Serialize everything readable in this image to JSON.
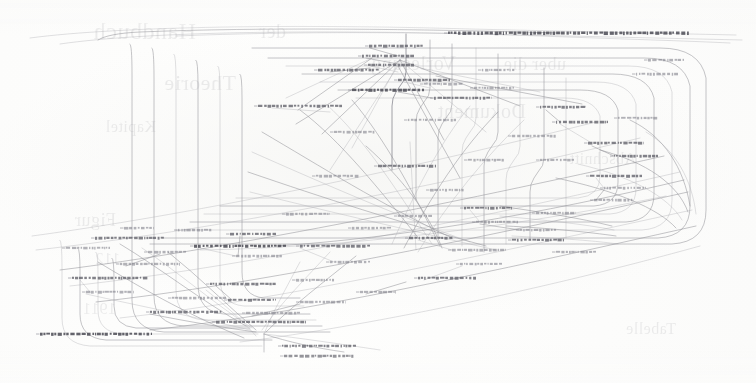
{
  "document": {
    "kind": "scanned-page",
    "content_type": "graph-diagram",
    "page_background_color": "#fdfdfc",
    "ink_color": "#6e6e78",
    "label_ink_color": "#55555f",
    "width": 756,
    "height": 383
  },
  "diagram": {
    "title": "",
    "caption": "",
    "edge_color": "#8f8f96",
    "label_color": "#5f5f68",
    "bounds": {
      "x": 28,
      "y": 22,
      "width": 700,
      "height": 328
    },
    "node_count": 68,
    "edge_count": 146,
    "nodes": [
      {
        "id": "n01",
        "x": 448,
        "y": 33,
        "w": 242,
        "h": 3.0,
        "weight": "hvy"
      },
      {
        "id": "n02",
        "x": 369,
        "y": 46,
        "w": 54,
        "h": 2.6,
        "weight": "norm"
      },
      {
        "id": "n03",
        "x": 362,
        "y": 56,
        "w": 52,
        "h": 2.6,
        "weight": "norm"
      },
      {
        "id": "n04",
        "x": 368,
        "y": 65,
        "w": 46,
        "h": 2.5,
        "weight": "norm"
      },
      {
        "id": "n05",
        "x": 318,
        "y": 70,
        "w": 62,
        "h": 2.5,
        "weight": "norm"
      },
      {
        "id": "n06",
        "x": 398,
        "y": 80,
        "w": 52,
        "h": 2.5,
        "weight": "norm"
      },
      {
        "id": "n07",
        "x": 352,
        "y": 90,
        "w": 72,
        "h": 2.6,
        "weight": "hvy"
      },
      {
        "id": "n08",
        "x": 424,
        "y": 84,
        "w": 40,
        "h": 2.4,
        "weight": "lite"
      },
      {
        "id": "n09",
        "x": 434,
        "y": 98,
        "w": 58,
        "h": 2.5,
        "weight": "norm"
      },
      {
        "id": "n10",
        "x": 258,
        "y": 106,
        "w": 84,
        "h": 2.5,
        "weight": "norm"
      },
      {
        "id": "n11",
        "x": 482,
        "y": 70,
        "w": 34,
        "h": 2.3,
        "weight": "lite"
      },
      {
        "id": "n12",
        "x": 474,
        "y": 88,
        "w": 40,
        "h": 2.4,
        "weight": "lite"
      },
      {
        "id": "n13",
        "x": 540,
        "y": 107,
        "w": 46,
        "h": 2.4,
        "weight": "norm"
      },
      {
        "id": "n14",
        "x": 556,
        "y": 122,
        "w": 52,
        "h": 2.5,
        "weight": "norm"
      },
      {
        "id": "n15",
        "x": 408,
        "y": 120,
        "w": 48,
        "h": 2.4,
        "weight": "lite"
      },
      {
        "id": "n16",
        "x": 512,
        "y": 136,
        "w": 44,
        "h": 2.4,
        "weight": "lite"
      },
      {
        "id": "n17",
        "x": 588,
        "y": 143,
        "w": 56,
        "h": 2.5,
        "weight": "norm"
      },
      {
        "id": "n18",
        "x": 614,
        "y": 156,
        "w": 44,
        "h": 2.4,
        "weight": "norm"
      },
      {
        "id": "n19",
        "x": 378,
        "y": 166,
        "w": 58,
        "h": 2.5,
        "weight": "norm"
      },
      {
        "id": "n20",
        "x": 316,
        "y": 176,
        "w": 44,
        "h": 2.4,
        "weight": "lite"
      },
      {
        "id": "n21",
        "x": 590,
        "y": 176,
        "w": 52,
        "h": 2.5,
        "weight": "norm"
      },
      {
        "id": "n22",
        "x": 604,
        "y": 188,
        "w": 42,
        "h": 2.4,
        "weight": "lite"
      },
      {
        "id": "n23",
        "x": 594,
        "y": 200,
        "w": 40,
        "h": 2.4,
        "weight": "lite"
      },
      {
        "id": "n24",
        "x": 464,
        "y": 208,
        "w": 48,
        "h": 2.4,
        "weight": "norm"
      },
      {
        "id": "n25",
        "x": 536,
        "y": 213,
        "w": 40,
        "h": 2.3,
        "weight": "lite"
      },
      {
        "id": "n26",
        "x": 476,
        "y": 222,
        "w": 42,
        "h": 2.4,
        "weight": "lite"
      },
      {
        "id": "n27",
        "x": 520,
        "y": 230,
        "w": 36,
        "h": 2.3,
        "weight": "lite"
      },
      {
        "id": "n28",
        "x": 95,
        "y": 238,
        "w": 70,
        "h": 2.5,
        "weight": "norm"
      },
      {
        "id": "n29",
        "x": 230,
        "y": 234,
        "w": 46,
        "h": 2.4,
        "weight": "norm"
      },
      {
        "id": "n30",
        "x": 409,
        "y": 238,
        "w": 44,
        "h": 2.4,
        "weight": "norm"
      },
      {
        "id": "n31",
        "x": 512,
        "y": 240,
        "w": 52,
        "h": 2.5,
        "weight": "norm"
      },
      {
        "id": "n32",
        "x": 194,
        "y": 246,
        "w": 92,
        "h": 2.6,
        "weight": "hvy"
      },
      {
        "id": "n33",
        "x": 300,
        "y": 246,
        "w": 70,
        "h": 2.5,
        "weight": "norm"
      },
      {
        "id": "n34",
        "x": 452,
        "y": 250,
        "w": 54,
        "h": 2.4,
        "weight": "lite"
      },
      {
        "id": "n35",
        "x": 236,
        "y": 256,
        "w": 48,
        "h": 2.4,
        "weight": "lite"
      },
      {
        "id": "n36",
        "x": 120,
        "y": 264,
        "w": 60,
        "h": 2.4,
        "weight": "lite"
      },
      {
        "id": "n37",
        "x": 330,
        "y": 262,
        "w": 40,
        "h": 2.3,
        "weight": "lite"
      },
      {
        "id": "n38",
        "x": 72,
        "y": 278,
        "w": 76,
        "h": 2.5,
        "weight": "norm"
      },
      {
        "id": "n39",
        "x": 210,
        "y": 284,
        "w": 66,
        "h": 2.5,
        "weight": "norm"
      },
      {
        "id": "n40",
        "x": 296,
        "y": 280,
        "w": 40,
        "h": 2.3,
        "weight": "lite"
      },
      {
        "id": "n41",
        "x": 418,
        "y": 278,
        "w": 58,
        "h": 2.5,
        "weight": "norm"
      },
      {
        "id": "n42",
        "x": 86,
        "y": 292,
        "w": 48,
        "h": 2.4,
        "weight": "lite"
      },
      {
        "id": "n43",
        "x": 228,
        "y": 300,
        "w": 48,
        "h": 2.4,
        "weight": "norm"
      },
      {
        "id": "n44",
        "x": 150,
        "y": 312,
        "w": 72,
        "h": 2.5,
        "weight": "norm"
      },
      {
        "id": "n45",
        "x": 300,
        "y": 302,
        "w": 46,
        "h": 2.4,
        "weight": "lite"
      },
      {
        "id": "n46",
        "x": 246,
        "y": 313,
        "w": 54,
        "h": 2.4,
        "weight": "lite"
      },
      {
        "id": "n47",
        "x": 216,
        "y": 322,
        "w": 90,
        "h": 2.5,
        "weight": "norm"
      },
      {
        "id": "n48",
        "x": 40,
        "y": 334,
        "w": 112,
        "h": 2.6,
        "weight": "hvy"
      },
      {
        "id": "n49",
        "x": 282,
        "y": 346,
        "w": 74,
        "h": 2.5,
        "weight": "norm"
      },
      {
        "id": "n50",
        "x": 284,
        "y": 356,
        "w": 70,
        "h": 2.5,
        "weight": "norm"
      },
      {
        "id": "n51",
        "x": 648,
        "y": 60,
        "w": 36,
        "h": 2.3,
        "weight": "lite"
      },
      {
        "id": "n52",
        "x": 636,
        "y": 74,
        "w": 42,
        "h": 2.4,
        "weight": "lite"
      },
      {
        "id": "n53",
        "x": 618,
        "y": 118,
        "w": 40,
        "h": 2.3,
        "weight": "lite"
      },
      {
        "id": "n54",
        "x": 66,
        "y": 248,
        "w": 44,
        "h": 2.4,
        "weight": "lite"
      },
      {
        "id": "n55",
        "x": 178,
        "y": 230,
        "w": 34,
        "h": 2.3,
        "weight": "lite"
      },
      {
        "id": "n56",
        "x": 352,
        "y": 228,
        "w": 40,
        "h": 2.3,
        "weight": "lite"
      },
      {
        "id": "n57",
        "x": 172,
        "y": 298,
        "w": 54,
        "h": 2.4,
        "weight": "lite"
      },
      {
        "id": "n58",
        "x": 430,
        "y": 190,
        "w": 34,
        "h": 2.3,
        "weight": "lite"
      },
      {
        "id": "n59",
        "x": 540,
        "y": 160,
        "w": 34,
        "h": 2.3,
        "weight": "lite"
      },
      {
        "id": "n60",
        "x": 286,
        "y": 214,
        "w": 44,
        "h": 2.4,
        "weight": "lite"
      },
      {
        "id": "n61",
        "x": 398,
        "y": 216,
        "w": 34,
        "h": 2.3,
        "weight": "lite"
      },
      {
        "id": "n62",
        "x": 460,
        "y": 264,
        "w": 42,
        "h": 2.3,
        "weight": "lite"
      },
      {
        "id": "n63",
        "x": 360,
        "y": 292,
        "w": 36,
        "h": 2.3,
        "weight": "lite"
      },
      {
        "id": "n64",
        "x": 148,
        "y": 252,
        "w": 38,
        "h": 2.3,
        "weight": "lite"
      },
      {
        "id": "n65",
        "x": 468,
        "y": 160,
        "w": 36,
        "h": 2.3,
        "weight": "lite"
      },
      {
        "id": "n66",
        "x": 334,
        "y": 132,
        "w": 42,
        "h": 2.3,
        "weight": "lite"
      },
      {
        "id": "n67",
        "x": 556,
        "y": 252,
        "w": 40,
        "h": 2.3,
        "weight": "lite"
      },
      {
        "id": "n68",
        "x": 124,
        "y": 228,
        "w": 30,
        "h": 2.2,
        "weight": "lite"
      }
    ]
  },
  "bleed_through_text": [
    {
      "text": "Handbuch",
      "x": 560,
      "y": 18,
      "size": 24
    },
    {
      "text": "der",
      "x": 470,
      "y": 20,
      "size": 20
    },
    {
      "text": "Vorlesung",
      "x": 300,
      "y": 52,
      "size": 20
    },
    {
      "text": "uber die",
      "x": 190,
      "y": 54,
      "size": 18
    },
    {
      "text": "Theorie",
      "x": 520,
      "y": 70,
      "size": 22
    },
    {
      "text": "Dokument",
      "x": 230,
      "y": 100,
      "size": 20
    },
    {
      "text": "Kapitel",
      "x": 600,
      "y": 118,
      "size": 16
    },
    {
      "text": "Abschnitt",
      "x": 120,
      "y": 150,
      "size": 16
    },
    {
      "text": "Figur",
      "x": 640,
      "y": 210,
      "size": 18
    },
    {
      "text": "112",
      "x": 636,
      "y": 250,
      "size": 16
    },
    {
      "text": "Tabelle",
      "x": 80,
      "y": 320,
      "size": 16
    },
    {
      "text": "1911",
      "x": 640,
      "y": 300,
      "size": 16
    }
  ]
}
